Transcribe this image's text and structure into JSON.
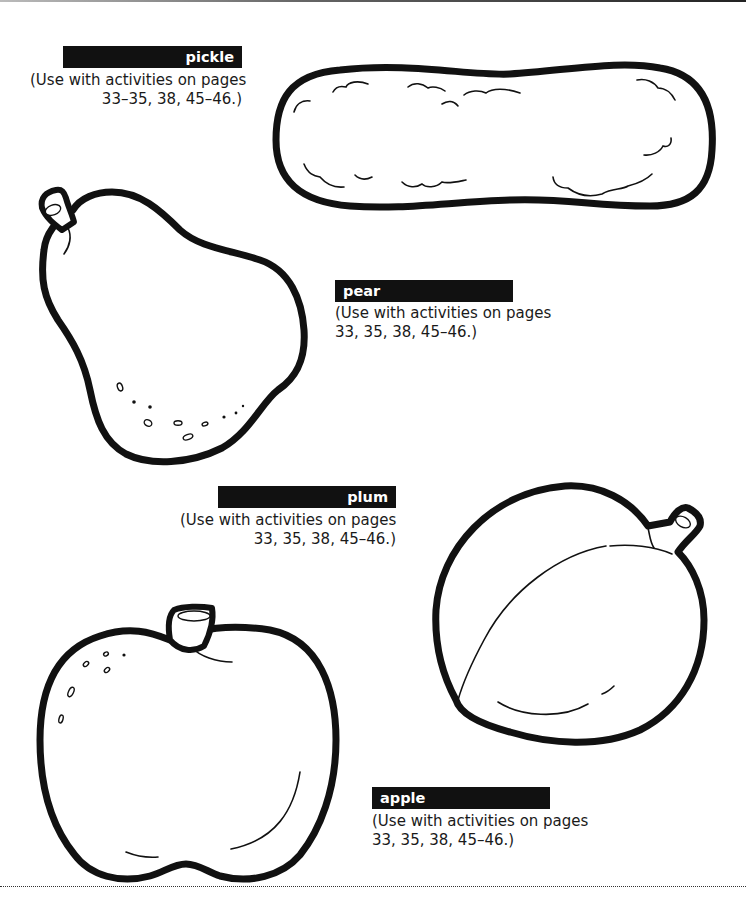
{
  "page": {
    "items": [
      {
        "name": "pickle",
        "label": "pickle",
        "caption_line1": "(Use with activities on pages",
        "caption_line2": "33–35, 38, 45–46.)"
      },
      {
        "name": "pear",
        "label": "pear",
        "caption_line1": "(Use with activities on pages",
        "caption_line2": "33, 35, 38, 45–46.)"
      },
      {
        "name": "plum",
        "label": "plum",
        "caption_line1": "(Use with activities on pages",
        "caption_line2": "33, 35, 38, 45–46.)"
      },
      {
        "name": "apple",
        "label": "apple",
        "caption_line1": "(Use with activities on pages",
        "caption_line2": "33, 35, 38, 45–46.)"
      }
    ],
    "colors": {
      "label_bg": "#111111",
      "label_text": "#ffffff",
      "line": "#111111",
      "paper": "#ffffff"
    }
  }
}
